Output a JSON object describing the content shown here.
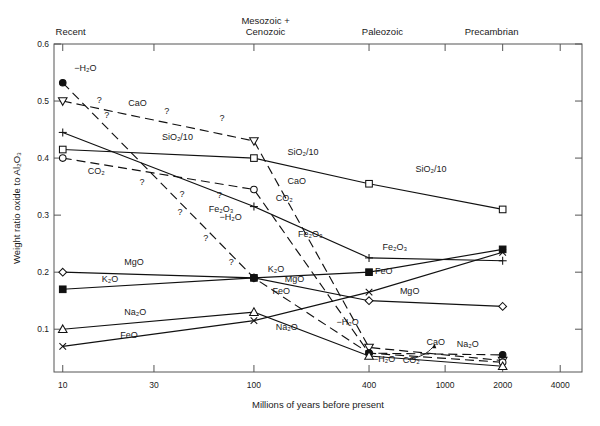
{
  "chart_data": {
    "type": "line",
    "title": "",
    "xlabel": "Millions of years before present",
    "ylabel": "Weight ratio oxide to Al₂O₃",
    "xscale": "log",
    "xlim": [
      9,
      5200
    ],
    "ylim": [
      0.025,
      0.6
    ],
    "xticks": [
      "10",
      "30",
      "100",
      "400",
      "1000",
      "2000",
      "4000"
    ],
    "xtick_values": [
      10,
      30,
      100,
      400,
      1000,
      2000,
      4000
    ],
    "yticks": [
      "0.1",
      "0.2",
      "0.3",
      "0.4",
      "0.5",
      "0.6"
    ],
    "ytick_values": [
      0.1,
      0.2,
      0.3,
      0.4,
      0.5,
      0.6
    ],
    "grid": false,
    "legend": "inline-labels",
    "era_labels": [
      {
        "text_line1": "Recent",
        "text_line2": "",
        "x": 11
      },
      {
        "text_line1": "Mesozoic +",
        "text_line2": "Cenozoic",
        "x": 115
      },
      {
        "text_line1": "Paleozoic",
        "text_line2": "",
        "x": 470
      },
      {
        "text_line1": "Precambrian",
        "text_line2": "",
        "x": 1750
      }
    ],
    "series": [
      {
        "name": "CaO",
        "marker": "triangle-down",
        "style": "dashed",
        "x": [
          10,
          100,
          400,
          2000
        ],
        "values": [
          0.5,
          0.43,
          0.068,
          0.045
        ],
        "labels": [
          {
            "text": "CaO",
            "x": 22,
            "y": 0.492
          },
          {
            "text": "CaO",
            "x": 150,
            "y": 0.355
          },
          {
            "text": "CaO",
            "x": 800,
            "y": 0.072
          }
        ],
        "question_marks": [
          {
            "x": 15.5,
            "y": 0.497
          },
          {
            "x": 35,
            "y": 0.478
          },
          {
            "x": 68,
            "y": 0.465
          }
        ]
      },
      {
        "name": "SiO₂/10",
        "marker": "square-open",
        "style": "solid",
        "x": [
          10,
          100,
          400,
          2000
        ],
        "values": [
          0.415,
          0.4,
          0.355,
          0.31
        ],
        "labels": [
          {
            "text": "SiO₂/10",
            "x": 33,
            "y": 0.432
          },
          {
            "text": "SiO₂/10",
            "x": 150,
            "y": 0.405
          },
          {
            "text": "SiO₂/10",
            "x": 700,
            "y": 0.375
          }
        ],
        "question_marks": []
      },
      {
        "name": "CO₂",
        "marker": "circle-open",
        "style": "dashed",
        "x": [
          10,
          100,
          400,
          2000
        ],
        "values": [
          0.4,
          0.345,
          0.058,
          0.042
        ],
        "labels": [
          {
            "text": "CO₂",
            "x": 13.5,
            "y": 0.372
          },
          {
            "text": "CO₂",
            "x": 130,
            "y": 0.325
          },
          {
            "text": "CO₂",
            "x": 600,
            "y": 0.04
          }
        ],
        "question_marks": [
          {
            "x": 26,
            "y": 0.352
          },
          {
            "x": 42,
            "y": 0.332
          },
          {
            "x": 66,
            "y": 0.33
          }
        ]
      },
      {
        "name": "Fe₂O₃",
        "marker": "plus",
        "style": "solid",
        "x": [
          10,
          100,
          400,
          2000
        ],
        "values": [
          0.445,
          0.315,
          0.225,
          0.22
        ],
        "labels": [
          {
            "text": "Fe₂O₃",
            "x": 58,
            "y": 0.305
          },
          {
            "text": "Fe₂O₃",
            "x": 170,
            "y": 0.262
          },
          {
            "text": "Fe₂O₃",
            "x": 470,
            "y": 0.238
          }
        ],
        "question_marks": []
      },
      {
        "name": "−H₂O",
        "marker": "circle-filled",
        "style": "dashed",
        "x": [
          10,
          100,
          400,
          2000
        ],
        "values": [
          0.532,
          0.19,
          0.058,
          0.055
        ],
        "labels": [
          {
            "text": "−H₂O",
            "x": 11.5,
            "y": 0.552
          },
          {
            "text": "−H₂O",
            "x": 66,
            "y": 0.292
          },
          {
            "text": "−H₂O",
            "x": 270,
            "y": 0.107
          },
          {
            "text": "−H₂O",
            "x": 420,
            "y": 0.043
          }
        ],
        "question_marks": [
          {
            "x": 17,
            "y": 0.47
          },
          {
            "x": 41,
            "y": 0.3
          },
          {
            "x": 56,
            "y": 0.255
          },
          {
            "x": 76,
            "y": 0.212
          }
        ]
      },
      {
        "name": "MgO",
        "marker": "diamond-open",
        "style": "solid",
        "x": [
          10,
          100,
          400,
          2000
        ],
        "values": [
          0.2,
          0.19,
          0.15,
          0.14
        ],
        "labels": [
          {
            "text": "MgO",
            "x": 21,
            "y": 0.213
          },
          {
            "text": "MgO",
            "x": 145,
            "y": 0.183
          },
          {
            "text": "MgO",
            "x": 580,
            "y": 0.162
          }
        ],
        "question_marks": []
      },
      {
        "name": "K₂O",
        "marker": "square-filled",
        "style": "solid",
        "x": [
          10,
          100,
          400,
          2000
        ],
        "values": [
          0.17,
          0.19,
          0.2,
          0.24
        ],
        "labels": [
          {
            "text": "K₂O",
            "x": 16,
            "y": 0.182
          },
          {
            "text": "K₂O",
            "x": 118,
            "y": 0.2
          }
        ],
        "question_marks": []
      },
      {
        "name": "Na₂O",
        "marker": "triangle-up",
        "style": "solid",
        "x": [
          10,
          100,
          400,
          2000
        ],
        "values": [
          0.1,
          0.13,
          0.053,
          0.035
        ],
        "labels": [
          {
            "text": "Na₂O",
            "x": 21,
            "y": 0.125
          },
          {
            "text": "Na₂O",
            "x": 130,
            "y": 0.098
          },
          {
            "text": "Na₂O",
            "x": 1150,
            "y": 0.069
          }
        ],
        "question_marks": []
      },
      {
        "name": "FeO",
        "marker": "cross",
        "style": "solid",
        "x": [
          10,
          100,
          400,
          2000
        ],
        "values": [
          0.07,
          0.115,
          0.165,
          0.235
        ],
        "labels": [
          {
            "text": "FeO",
            "x": 20,
            "y": 0.085
          },
          {
            "text": "FeO",
            "x": 125,
            "y": 0.162
          },
          {
            "text": "FeO",
            "x": 430,
            "y": 0.196
          }
        ],
        "question_marks": []
      }
    ]
  }
}
